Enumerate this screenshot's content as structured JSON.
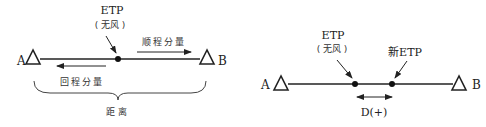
{
  "left_diagram": {
    "point_a": "A",
    "point_b": "B",
    "etp_label": "ETP",
    "etp_sublabel": "( 无风 )",
    "outbound_component": "顺程分量",
    "return_component": "回程分量",
    "distance_label": "距离"
  },
  "right_diagram": {
    "point_a": "A",
    "point_b": "B",
    "etp_label": "ETP",
    "etp_sublabel": "( 无风 )",
    "new_etp_label": "新ETP",
    "displacement_label": "D(+)"
  },
  "colors": {
    "line": "#222222",
    "text": "#222222"
  }
}
